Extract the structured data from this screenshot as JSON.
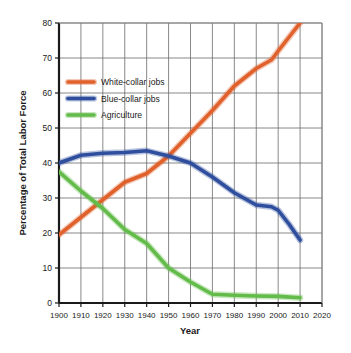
{
  "chart_data": {
    "type": "line",
    "title": "",
    "xlabel": "Year",
    "ylabel": "Percentage of Total Labor Force",
    "xlim": [
      1900,
      2020
    ],
    "ylim": [
      0,
      80
    ],
    "xticks": [
      1900,
      1910,
      1920,
      1930,
      1940,
      1950,
      1960,
      1970,
      1980,
      1990,
      2000,
      2010,
      2020
    ],
    "yticks": [
      0,
      10,
      20,
      30,
      40,
      50,
      60,
      70,
      80
    ],
    "grid": true,
    "legend_position": "upper-left-inside",
    "series": [
      {
        "name": "White-collar jobs",
        "color": "#E0612B",
        "x": [
          1900,
          1910,
          1920,
          1930,
          1940,
          1950,
          1960,
          1970,
          1980,
          1990,
          1997,
          2000,
          2005,
          2010
        ],
        "values": [
          19.5,
          24.5,
          29.5,
          34.5,
          37,
          42,
          48.5,
          55,
          62,
          67,
          69.5,
          72,
          76,
          80
        ]
      },
      {
        "name": "Blue-collar jobs",
        "color": "#2F4F9E",
        "x": [
          1900,
          1910,
          1920,
          1930,
          1940,
          1950,
          1960,
          1970,
          1980,
          1990,
          1997,
          2000,
          2005,
          2010
        ],
        "values": [
          40,
          42.2,
          42.8,
          43,
          43.5,
          42,
          40,
          36,
          31.5,
          28,
          27.5,
          26.5,
          22.5,
          18
        ]
      },
      {
        "name": "Agriculture",
        "color": "#63BB4A",
        "x": [
          1900,
          1910,
          1920,
          1930,
          1940,
          1950,
          1960,
          1970,
          1980,
          1990,
          2000,
          2010
        ],
        "values": [
          37.5,
          32,
          27,
          21,
          17,
          10,
          6,
          2.5,
          2.2,
          2,
          1.9,
          1.5
        ]
      }
    ]
  },
  "axes": {
    "y_title": "Percentage of Total Labor Force",
    "x_title": "Year",
    "y_tick_labels": [
      "80",
      "70",
      "60",
      "50",
      "40",
      "30",
      "20",
      "10",
      "0"
    ],
    "x_tick_labels": [
      "1900",
      "1910",
      "1920",
      "1930",
      "1940",
      "1950",
      "1960",
      "1970",
      "1980",
      "1990",
      "2000",
      "2010",
      "2020"
    ]
  },
  "legend": {
    "items": [
      {
        "label": "White-collar jobs",
        "color": "#E0612B"
      },
      {
        "label": "Blue-collar jobs",
        "color": "#2F4F9E"
      },
      {
        "label": "Agriculture",
        "color": "#63BB4A"
      }
    ]
  },
  "colors": {
    "white_collar": "#E0612B",
    "blue_collar": "#2F4F9E",
    "agriculture": "#63BB4A",
    "axis": "#1a1a1a",
    "grid": "#6b6b6b",
    "background": "#ffffff"
  }
}
